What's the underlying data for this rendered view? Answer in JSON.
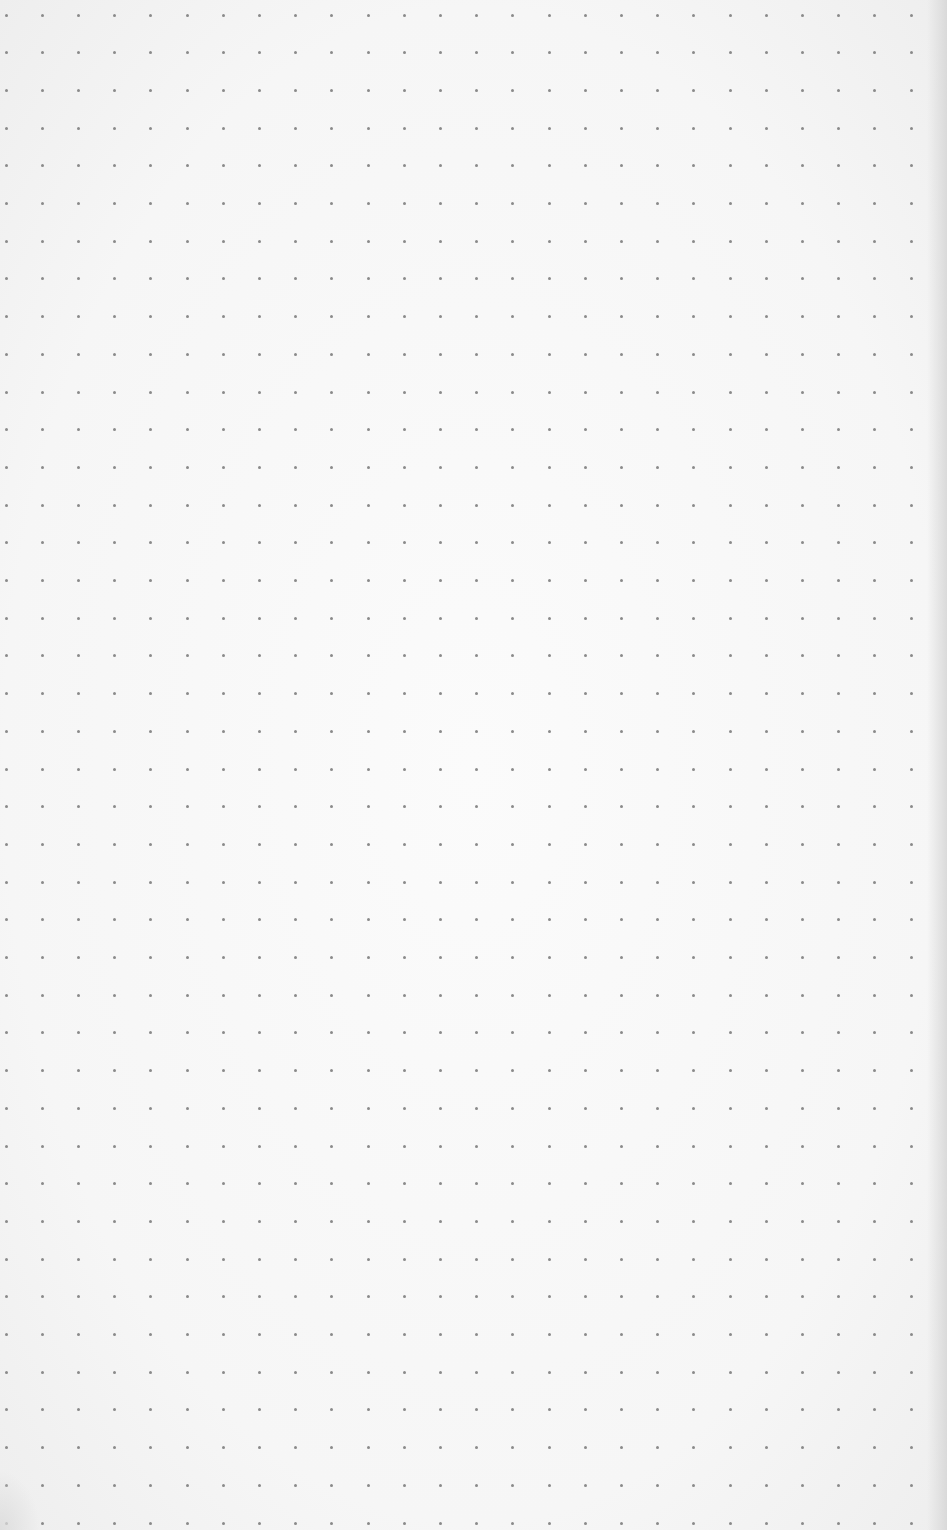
{
  "paper": {
    "background_color": "#f7f7f7",
    "dot_color": "#8a8a8a",
    "dot_diameter": 3
  },
  "grid": {
    "columns": 26,
    "rows": 41,
    "origin_x": 6,
    "origin_y": 15,
    "spacing_x": 36.2,
    "spacing_y": 37.7
  }
}
